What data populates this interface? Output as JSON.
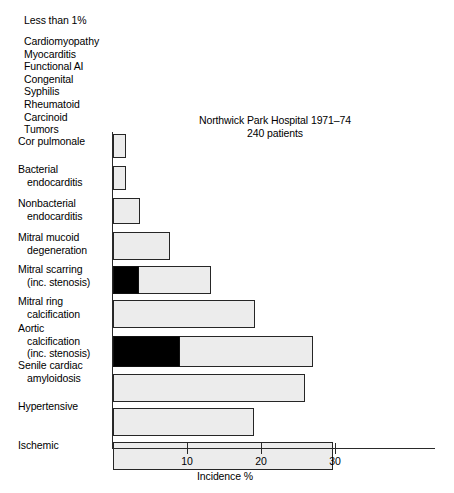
{
  "note": {
    "heading": "Less than 1%",
    "items": [
      "Cardiomyopathy",
      "Myocarditis",
      "Functional AI",
      "Congenital",
      "Syphilis",
      "Rheumatoid",
      "Carcinoid",
      "Tumors"
    ]
  },
  "chart_data": {
    "type": "bar",
    "orientation": "horizontal",
    "title": "Northwick Park Hospital 1971–74",
    "subtitle": "240 patients",
    "xlabel": "Incidence %",
    "ylabel": "",
    "xlim": [
      0,
      30
    ],
    "xticks": [
      10,
      20,
      30
    ],
    "xticklabels": [
      "10",
      "20",
      "30"
    ],
    "grid": false,
    "legend": false,
    "categories": [
      "Cor pulmonale",
      "Bacterial endocarditis",
      "Nonbacterial endocarditis",
      "Mitral mucoid degeneration",
      "Mitral scarring (inc. stenosis)",
      "Mitral ring calcification",
      "Aortic calcification (inc. stenosis)",
      "Senile cardiac amyloidosis",
      "Hypertensive",
      "Ischemic"
    ],
    "category_lines": [
      [
        "Cor pulmonale"
      ],
      [
        "Bacterial",
        "endocarditis"
      ],
      [
        "Nonbacterial",
        "endocarditis"
      ],
      [
        "Mitral mucoid",
        "degeneration"
      ],
      [
        "Mitral scarring",
        "(inc. stenosis)"
      ],
      [
        "Mitral ring",
        "calcification"
      ],
      [
        "Aortic",
        "calcification",
        "(inc. stenosis)"
      ],
      [
        "Senile cardiac",
        "amyloidosis"
      ],
      [
        "Hypertensive"
      ],
      [
        "Ischemic"
      ]
    ],
    "values": [
      1.7,
      1.7,
      3.7,
      7.7,
      13.2,
      19.2,
      27.0,
      26.0,
      19.0,
      29.7
    ],
    "series": [
      {
        "name": "Total incidence",
        "color": "#ececec",
        "values": [
          1.7,
          1.7,
          3.7,
          7.7,
          13.2,
          19.2,
          27.0,
          26.0,
          19.0,
          29.7
        ]
      },
      {
        "name": "Stenosis (filled)",
        "color": "#000000",
        "values": [
          0,
          0,
          0,
          0,
          3.5,
          0,
          9.0,
          0,
          0,
          0
        ]
      }
    ]
  },
  "axis": {
    "tick_values": [
      10,
      20,
      30
    ],
    "x_axis_label": "Incidence %"
  }
}
